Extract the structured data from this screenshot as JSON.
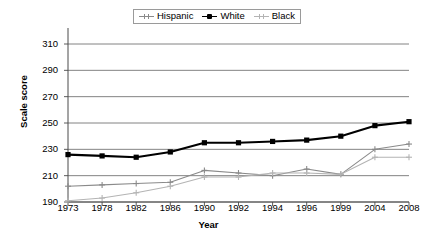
{
  "chart_data": {
    "type": "line",
    "title": "",
    "xlabel": "Year",
    "ylabel": "Scale score",
    "categories": [
      "1973",
      "1978",
      "1982",
      "1986",
      "1990",
      "1992",
      "1994",
      "1996",
      "1999",
      "2004",
      "2008"
    ],
    "ylim": [
      190,
      310
    ],
    "y_ticks": [
      190,
      210,
      230,
      250,
      270,
      290,
      310
    ],
    "grid": "horizontal",
    "legend_position": "top-center",
    "series": [
      {
        "name": "Hispanic",
        "color": "#8a8a8a",
        "marker": "cross",
        "values": [
          202,
          203,
          204,
          205,
          214,
          212,
          210,
          215,
          211,
          230,
          234
        ]
      },
      {
        "name": "White",
        "color": "#000000",
        "marker": "square",
        "values": [
          226,
          225,
          224,
          228,
          235,
          235,
          236,
          237,
          240,
          248,
          251
        ]
      },
      {
        "name": "Black",
        "color": "#b4b4b4",
        "marker": "cross",
        "values": [
          191,
          193,
          197,
          202,
          209,
          209,
          212,
          212,
          211,
          224,
          224
        ]
      }
    ]
  },
  "legend": {
    "items": [
      {
        "label": "Hispanic"
      },
      {
        "label": "White"
      },
      {
        "label": "Black"
      }
    ]
  },
  "axes": {
    "y_title": "Scale score",
    "x_title": "Year"
  }
}
